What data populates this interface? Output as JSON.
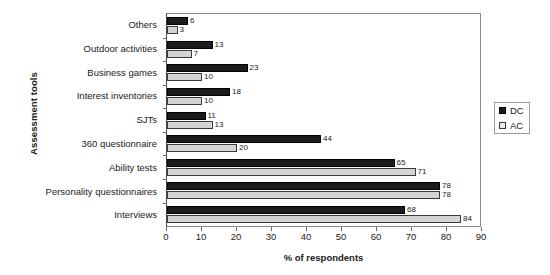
{
  "chart_data": {
    "type": "bar",
    "orientation": "horizontal",
    "title": "",
    "xlabel": "% of respondents",
    "ylabel": "Assessment tools",
    "xlim": [
      0,
      90
    ],
    "xticks": [
      0,
      10,
      20,
      30,
      40,
      50,
      60,
      70,
      80,
      90
    ],
    "grid": false,
    "legend_position": "right",
    "categories": [
      "Others",
      "Outdoor activities",
      "Business games",
      "Interest inventories",
      "SJTs",
      "360 questionnaire",
      "Ability tests",
      "Personality questionnaires",
      "Interviews"
    ],
    "series": [
      {
        "name": "DC",
        "color": "#1c1c1c",
        "values": [
          6,
          13,
          23,
          18,
          11,
          44,
          65,
          78,
          68
        ]
      },
      {
        "name": "AC",
        "color": "#d4d4d4",
        "values": [
          3,
          7,
          10,
          10,
          13,
          20,
          71,
          78,
          84
        ]
      }
    ]
  },
  "legend": {
    "items": [
      {
        "label": "DC",
        "swatch": "filled-black-square-icon"
      },
      {
        "label": "AC",
        "swatch": "outlined-light-square-icon"
      }
    ]
  }
}
